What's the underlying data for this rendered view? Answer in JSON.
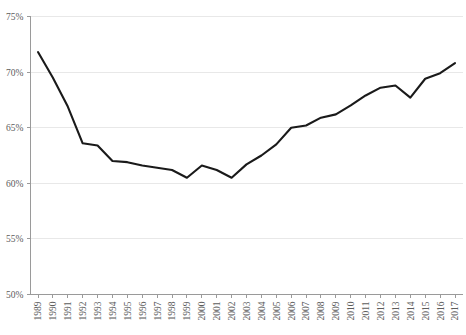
{
  "chart_data": {
    "type": "line",
    "title": "",
    "subtitle": "",
    "xlabel": "",
    "ylabel": "",
    "ylim": [
      50,
      75
    ],
    "ytick_labels": [
      "75%",
      "70%",
      "65%",
      "60%",
      "55%",
      "50%"
    ],
    "ytick_values": [
      75,
      70,
      65,
      60,
      55,
      50
    ],
    "grid": true,
    "legend": false,
    "legend_position": "none",
    "annotations": [],
    "categories": [
      "1989",
      "1990",
      "1991",
      "1992",
      "1993",
      "1994",
      "1995",
      "1996",
      "1997",
      "1998",
      "1999",
      "2000",
      "2001",
      "2002",
      "2003",
      "2004",
      "2005",
      "2006",
      "2007",
      "2008",
      "2009",
      "2010",
      "2011",
      "2012",
      "2013",
      "2014",
      "2015",
      "2016",
      "2017"
    ],
    "series": [
      {
        "name": "",
        "color": "#1a1a1a",
        "values": [
          71.8,
          69.5,
          66.9,
          63.6,
          63.4,
          62.0,
          61.9,
          61.6,
          61.4,
          61.2,
          60.5,
          61.6,
          61.2,
          60.5,
          61.7,
          62.5,
          63.5,
          65.0,
          65.2,
          65.9,
          66.2,
          67.0,
          67.9,
          68.6,
          68.8,
          67.7,
          69.4,
          69.9,
          70.8
        ]
      }
    ]
  },
  "axes": {
    "y_axis_name": "percent-axis",
    "x_axis_name": "year-axis"
  }
}
